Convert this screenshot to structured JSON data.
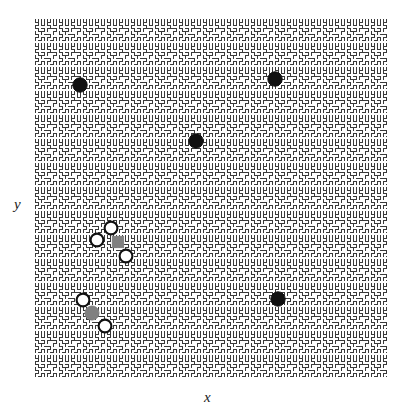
{
  "figure": {
    "width": 414,
    "height": 413,
    "background_color": "#ffffff"
  },
  "axes": {
    "xlabel": "x",
    "ylabel": "y",
    "x_label_style": "italic-serif",
    "y_label_style": "italic-serif",
    "tick_labels_shown": false,
    "spines_shown": false,
    "plot_left": 34,
    "plot_top": 18,
    "plot_width": 353,
    "plot_height": 360
  },
  "background_pattern": {
    "name": "hilbert-curve-tiling",
    "description": "Repeating Hilbert space-filling curve motif tiled across the plot area",
    "stroke_color": "#3a3a3a",
    "fill_color": "#ffffff",
    "stroke_width": 1.6,
    "tile_size": 24,
    "tiles_x": 15,
    "tiles_y": 15
  },
  "chart_data": {
    "type": "scatter",
    "title": "",
    "xlabel": "x",
    "ylabel": "y",
    "grid": false,
    "legend_position": "none",
    "xlim": [
      0,
      1
    ],
    "ylim": [
      0,
      1
    ],
    "series": [
      {
        "name": "filled-black-circles",
        "marker": "circle",
        "facecolor": "#111111",
        "edgecolor": "#111111",
        "size": 14,
        "points": [
          {
            "x": 0.131,
            "y": 0.814
          },
          {
            "x": 0.683,
            "y": 0.831
          },
          {
            "x": 0.459,
            "y": 0.658
          },
          {
            "x": 0.691,
            "y": 0.219
          }
        ]
      },
      {
        "name": "open-white-circles",
        "marker": "circle",
        "facecolor": "#ffffff",
        "edgecolor": "#111111",
        "size": 13,
        "points": [
          {
            "x": 0.218,
            "y": 0.417
          },
          {
            "x": 0.178,
            "y": 0.383
          },
          {
            "x": 0.261,
            "y": 0.339
          },
          {
            "x": 0.139,
            "y": 0.217
          },
          {
            "x": 0.201,
            "y": 0.144
          }
        ]
      },
      {
        "name": "gray-square-marker",
        "marker": "square",
        "facecolor": "#808080",
        "edgecolor": "#808080",
        "size": 11,
        "points": [
          {
            "x": 0.238,
            "y": 0.378
          }
        ]
      },
      {
        "name": "gray-circle-marker",
        "marker": "circle",
        "facecolor": "#808080",
        "edgecolor": "#808080",
        "size": 14,
        "points": [
          {
            "x": 0.164,
            "y": 0.181
          }
        ]
      }
    ],
    "markers_pixels": [
      {
        "group": "filled-black-circles",
        "shape": "circle",
        "cx": 80,
        "cy": 85,
        "r": 7.2,
        "fill": "#111111",
        "stroke": "#111111"
      },
      {
        "group": "filled-black-circles",
        "shape": "circle",
        "cx": 275,
        "cy": 79,
        "r": 7.2,
        "fill": "#111111",
        "stroke": "#111111"
      },
      {
        "group": "filled-black-circles",
        "shape": "circle",
        "cx": 196,
        "cy": 141,
        "r": 7.2,
        "fill": "#111111",
        "stroke": "#111111"
      },
      {
        "group": "filled-black-circles",
        "shape": "circle",
        "cx": 278,
        "cy": 299,
        "r": 7.2,
        "fill": "#111111",
        "stroke": "#111111"
      },
      {
        "group": "gray-square-marker",
        "shape": "square",
        "cx": 118,
        "cy": 242,
        "r": 5.6,
        "fill": "#808080",
        "stroke": "#808080"
      },
      {
        "group": "gray-circle-marker",
        "shape": "circle",
        "cx": 92,
        "cy": 313,
        "r": 7.0,
        "fill": "#808080",
        "stroke": "#808080"
      },
      {
        "group": "open-white-circles",
        "shape": "circle",
        "cx": 111,
        "cy": 228,
        "r": 6.4,
        "fill": "#ffffff",
        "stroke": "#111111"
      },
      {
        "group": "open-white-circles",
        "shape": "circle",
        "cx": 97,
        "cy": 240,
        "r": 6.4,
        "fill": "#ffffff",
        "stroke": "#111111"
      },
      {
        "group": "open-white-circles",
        "shape": "circle",
        "cx": 126,
        "cy": 256,
        "r": 6.4,
        "fill": "#ffffff",
        "stroke": "#111111"
      },
      {
        "group": "open-white-circles",
        "shape": "circle",
        "cx": 83,
        "cy": 300,
        "r": 6.4,
        "fill": "#ffffff",
        "stroke": "#111111"
      },
      {
        "group": "open-white-circles",
        "shape": "circle",
        "cx": 105,
        "cy": 326,
        "r": 6.4,
        "fill": "#ffffff",
        "stroke": "#111111"
      }
    ]
  }
}
